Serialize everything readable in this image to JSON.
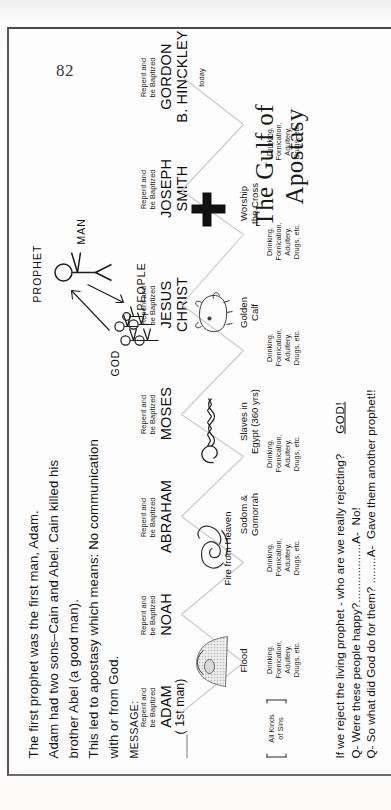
{
  "page": {
    "number": "82",
    "title_line1": "The Gulf of",
    "title_line2": "Apostasy"
  },
  "intro": {
    "line1": "The first prophet was the first man, Adam.",
    "line2": "Adam had two sons–Cain and Abel. Cain killed his",
    "line3": "brother Abel (a good man).",
    "line4": "This led to apostasy which means: No communication",
    "line5": "with or from God."
  },
  "message_label": "MESSAGE:",
  "message_text_line1": "Repent and",
  "message_text_line2": "be Baptized",
  "prophets": [
    {
      "name": "ADAM",
      "sub": "( 1st man)",
      "message1": "Repent and",
      "message2": "be Baptized"
    },
    {
      "name": "NOAH",
      "sub": "",
      "message1": "Repent and",
      "message2": "be Baptized"
    },
    {
      "name": "ABRAHAM",
      "sub": "",
      "message1": "Repent and",
      "message2": "be Baptized"
    },
    {
      "name": "MOSES",
      "sub": "",
      "message1": "Repent and",
      "message2": "be Baptized"
    },
    {
      "name": "JESUS",
      "sub": "CHRIST",
      "message1": "Repent and",
      "message2": "be Baptized"
    },
    {
      "name": "JOSEPH",
      "sub": "SMITH",
      "message1": "Repent and",
      "message2": "be Baptized"
    },
    {
      "name": "GORDON",
      "sub": "B. HINCKLEY",
      "message1": "Repent and",
      "message2": "be Baptized",
      "footnote": "today"
    }
  ],
  "events": [
    {
      "line1": "Flood",
      "line2": ""
    },
    {
      "line1": "Fire from Heaven",
      "line2": ""
    },
    {
      "line1": "Sodom &",
      "line2": "Gomorrah"
    },
    {
      "line1": "Slaves in",
      "line2": "Egypt (360 yrs)"
    },
    {
      "line1": "Golden",
      "line2": "Calf"
    },
    {
      "line1": "Worship",
      "line2": "the Cross"
    }
  ],
  "sins_bracket": {
    "line1": "All Kinds",
    "line2": "of Sins"
  },
  "sins": {
    "line1": "Drinking,",
    "line2": "Fornication,",
    "line3": "Adultery,",
    "line4": "Drugs, etc."
  },
  "sins_repeat_count": 6,
  "god_diagram": {
    "god_label": "GOD",
    "prophet_label": "PROPHET",
    "man_label": "MAN",
    "people_label": "PEOPLE"
  },
  "cross_symbol": "cross",
  "questions": {
    "intro": "If we reject the living prophet - who are we really rejecting?",
    "god_answer": "GOD!",
    "q1": "Q- Were these people happy?",
    "q1_dots": "..................",
    "a1": "A-  No!",
    "q2": "Q- So what did God do for them?",
    "q2_dots": " ........",
    "a2": "A-  Gave them another prophet!!"
  },
  "colors": {
    "ink": "#141414",
    "paper": "#fdfdfd",
    "frame": "#4a4a4c",
    "faint_line": "#c2c2c2"
  }
}
